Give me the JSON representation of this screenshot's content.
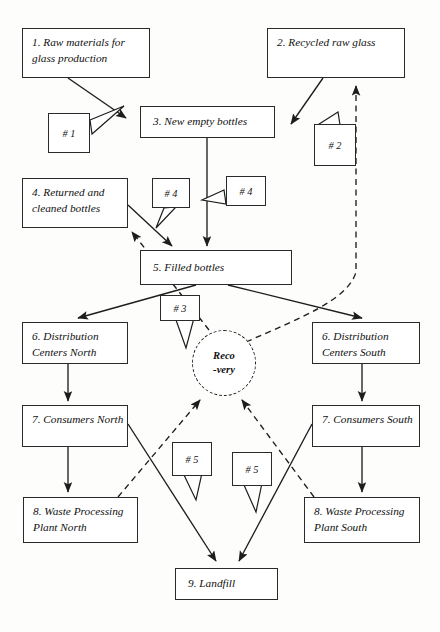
{
  "diagram": {
    "background_color": "#fdfdfc",
    "line_color": "#2a2a2a"
  },
  "nodes": [
    {
      "id": "n1",
      "label": "1. Raw materials for glass production"
    },
    {
      "id": "n2",
      "label": "2. Recycled raw glass"
    },
    {
      "id": "n3",
      "label": "3. New empty bottles"
    },
    {
      "id": "n4",
      "label": "4. Returned and cleaned bottles"
    },
    {
      "id": "n5",
      "label": "5. Filled bottles"
    },
    {
      "id": "n6n",
      "label": "6. Distribution Centers North"
    },
    {
      "id": "n6s",
      "label": "6. Distribution Centers South"
    },
    {
      "id": "n7n",
      "label": "7. Consumers North"
    },
    {
      "id": "n7s",
      "label": "7. Consumers South"
    },
    {
      "id": "n8n",
      "label": "8. Waste Processing Plant North"
    },
    {
      "id": "n8s",
      "label": "8. Waste Processing Plant South"
    },
    {
      "id": "n9",
      "label": "9. Landfill"
    }
  ],
  "recovery": {
    "line1": "Reco",
    "line2": "-very"
  },
  "callouts": [
    {
      "id": "c1",
      "label": "# 1"
    },
    {
      "id": "c2",
      "label": "# 2"
    },
    {
      "id": "c3",
      "label": "# 3"
    },
    {
      "id": "c4a",
      "label": "# 4"
    },
    {
      "id": "c4b",
      "label": "# 4"
    },
    {
      "id": "c5a",
      "label": "# 5"
    },
    {
      "id": "c5b",
      "label": "# 5"
    }
  ]
}
